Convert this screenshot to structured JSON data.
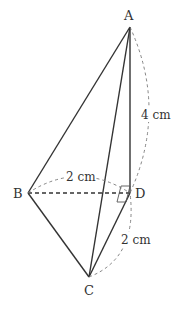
{
  "figure": {
    "type": "triangular pyramid (tetrahedron) with right angles at D",
    "points": {
      "A": {
        "label": "A",
        "x": 130,
        "y": 27
      },
      "B": {
        "label": "B",
        "x": 28,
        "y": 193
      },
      "C": {
        "label": "C",
        "x": 89,
        "y": 277
      },
      "D": {
        "label": "D",
        "x": 130,
        "y": 193
      }
    },
    "solid_edges": [
      "AB",
      "AC",
      "AD",
      "BC",
      "CD"
    ],
    "hidden_edges": [
      "BD"
    ],
    "measurements": {
      "AD": "4 cm",
      "BD": "2 cm",
      "CD": "2 cm"
    },
    "right_angle_marker": "D",
    "colors": {
      "line": "#333333",
      "dashed": "#777777",
      "background": "#ffffff"
    }
  }
}
